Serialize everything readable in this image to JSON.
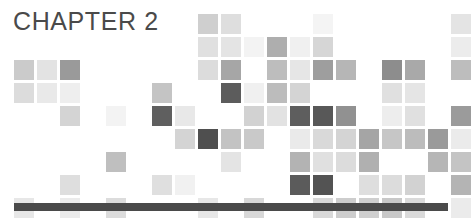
{
  "page": {
    "width": 461,
    "height": 222,
    "background": "#ffffff"
  },
  "header": {
    "title": "CHAPTER 2",
    "title_color": "#4a4a4a"
  },
  "rule": {
    "label": "horizontal-rule",
    "color": "#4a4a4a",
    "x": 14,
    "y": 203,
    "width": 434,
    "height": 8
  },
  "mosaic": {
    "label": "decorative-square-mosaic",
    "origin_x": 14,
    "origin_y": 14,
    "cell": 20,
    "pitch": 23,
    "columns": 20,
    "rows": 8,
    "palette": {
      "faint": "#f2f2f2",
      "pale": "#ebebeb",
      "light": "#e2e2e2",
      "light_mid": "#d8d8d8",
      "mid": "#cccccc",
      "mid_dark": "#b4b4b4",
      "gray": "#a0a0a0",
      "dark_gray": "#8c8c8c",
      "dark": "#6e6e6e",
      "darkest": "#4f4f4f"
    },
    "tiles": [
      {
        "c": 8,
        "r": 0,
        "color": "#cfcfcf"
      },
      {
        "c": 9,
        "r": 0,
        "color": "#dedede"
      },
      {
        "c": 13,
        "r": 0,
        "color": "#f4f4f4"
      },
      {
        "c": 19,
        "r": 0,
        "color": "#e4e4e4"
      },
      {
        "c": 8,
        "r": 1,
        "color": "#e0e0e0"
      },
      {
        "c": 9,
        "r": 1,
        "color": "#e4e4e4"
      },
      {
        "c": 10,
        "r": 1,
        "color": "#f3f3f3"
      },
      {
        "c": 11,
        "r": 1,
        "color": "#aeaeae"
      },
      {
        "c": 12,
        "r": 1,
        "color": "#f0f0f0"
      },
      {
        "c": 13,
        "r": 1,
        "color": "#d6d6d6"
      },
      {
        "c": 19,
        "r": 1,
        "color": "#ececec"
      },
      {
        "c": 0,
        "r": 2,
        "color": "#cbcbcb"
      },
      {
        "c": 1,
        "r": 2,
        "color": "#e3e3e3"
      },
      {
        "c": 2,
        "r": 2,
        "color": "#9a9a9a"
      },
      {
        "c": 8,
        "r": 2,
        "color": "#dcdcdc"
      },
      {
        "c": 9,
        "r": 2,
        "color": "#a6a6a6"
      },
      {
        "c": 11,
        "r": 2,
        "color": "#bdbdbd"
      },
      {
        "c": 12,
        "r": 2,
        "color": "#e6e6e6"
      },
      {
        "c": 13,
        "r": 2,
        "color": "#9e9e9e"
      },
      {
        "c": 14,
        "r": 2,
        "color": "#b6b6b6"
      },
      {
        "c": 16,
        "r": 2,
        "color": "#8d8d8d"
      },
      {
        "c": 17,
        "r": 2,
        "color": "#a9a9a9"
      },
      {
        "c": 19,
        "r": 2,
        "color": "#bdbdbd"
      },
      {
        "c": 0,
        "r": 3,
        "color": "#dcdcdc"
      },
      {
        "c": 1,
        "r": 3,
        "color": "#e9e9e9"
      },
      {
        "c": 2,
        "r": 3,
        "color": "#eeeeee"
      },
      {
        "c": 6,
        "r": 3,
        "color": "#c4c4c4"
      },
      {
        "c": 9,
        "r": 3,
        "color": "#5c5c5c"
      },
      {
        "c": 10,
        "r": 3,
        "color": "#f0f0f0"
      },
      {
        "c": 11,
        "r": 3,
        "color": "#bcbcbc"
      },
      {
        "c": 12,
        "r": 3,
        "color": "#d4d4d4"
      },
      {
        "c": 16,
        "r": 3,
        "color": "#e0e0e0"
      },
      {
        "c": 17,
        "r": 3,
        "color": "#e5e5e5"
      },
      {
        "c": 2,
        "r": 4,
        "color": "#d4d4d4"
      },
      {
        "c": 4,
        "r": 4,
        "color": "#f3f3f3"
      },
      {
        "c": 6,
        "r": 4,
        "color": "#5f5f5f"
      },
      {
        "c": 7,
        "r": 4,
        "color": "#e8e8e8"
      },
      {
        "c": 10,
        "r": 4,
        "color": "#d2d2d2"
      },
      {
        "c": 11,
        "r": 4,
        "color": "#e2e2e2"
      },
      {
        "c": 12,
        "r": 4,
        "color": "#5e5e5e"
      },
      {
        "c": 13,
        "r": 4,
        "color": "#585858"
      },
      {
        "c": 14,
        "r": 4,
        "color": "#919191"
      },
      {
        "c": 16,
        "r": 4,
        "color": "#ededed"
      },
      {
        "c": 17,
        "r": 4,
        "color": "#e0e0e0"
      },
      {
        "c": 19,
        "r": 4,
        "color": "#9b9b9b"
      },
      {
        "c": 7,
        "r": 5,
        "color": "#d4d4d4"
      },
      {
        "c": 8,
        "r": 5,
        "color": "#4f4f4f"
      },
      {
        "c": 9,
        "r": 5,
        "color": "#c3c3c3"
      },
      {
        "c": 10,
        "r": 5,
        "color": "#c9c9c9"
      },
      {
        "c": 12,
        "r": 5,
        "color": "#eaeaea"
      },
      {
        "c": 13,
        "r": 5,
        "color": "#d9d9d9"
      },
      {
        "c": 14,
        "r": 5,
        "color": "#d4d4d4"
      },
      {
        "c": 15,
        "r": 5,
        "color": "#a5a5a5"
      },
      {
        "c": 16,
        "r": 5,
        "color": "#c6c6c6"
      },
      {
        "c": 17,
        "r": 5,
        "color": "#bcbcbc"
      },
      {
        "c": 18,
        "r": 5,
        "color": "#9a9a9a"
      },
      {
        "c": 19,
        "r": 5,
        "color": "#ebebeb"
      },
      {
        "c": 4,
        "r": 6,
        "color": "#bfbfbf"
      },
      {
        "c": 9,
        "r": 6,
        "color": "#e4e4e4"
      },
      {
        "c": 12,
        "r": 6,
        "color": "#b3b3b3"
      },
      {
        "c": 13,
        "r": 6,
        "color": "#e0e0e0"
      },
      {
        "c": 14,
        "r": 6,
        "color": "#dcdcdc"
      },
      {
        "c": 15,
        "r": 6,
        "color": "#b0b0b0"
      },
      {
        "c": 18,
        "r": 6,
        "color": "#b6b6b6"
      },
      {
        "c": 19,
        "r": 6,
        "color": "#c4c4c4"
      },
      {
        "c": 2,
        "r": 7,
        "color": "#dedede"
      },
      {
        "c": 6,
        "r": 7,
        "color": "#dfdfdf"
      },
      {
        "c": 7,
        "r": 7,
        "color": "#f1f1f1"
      },
      {
        "c": 12,
        "r": 7,
        "color": "#5b5b5b"
      },
      {
        "c": 13,
        "r": 7,
        "color": "#535353"
      },
      {
        "c": 15,
        "r": 7,
        "color": "#dedede"
      },
      {
        "c": 16,
        "r": 7,
        "color": "#dcdcdc"
      },
      {
        "c": 17,
        "r": 7,
        "color": "#d2d2d2"
      },
      {
        "c": 19,
        "r": 7,
        "color": "#b4b4b4"
      },
      {
        "c": 0,
        "r": 8,
        "color": "#e7e7e7"
      },
      {
        "c": 2,
        "r": 8,
        "color": "#ebebeb"
      },
      {
        "c": 4,
        "r": 8,
        "color": "#dcdcdc"
      },
      {
        "c": 8,
        "r": 8,
        "color": "#e7e7e7"
      },
      {
        "c": 10,
        "r": 8,
        "color": "#d8d8d8"
      },
      {
        "c": 13,
        "r": 8,
        "color": "#d9d9d9"
      },
      {
        "c": 14,
        "r": 8,
        "color": "#cdcdcd"
      },
      {
        "c": 15,
        "r": 8,
        "color": "#cfcfcf"
      },
      {
        "c": 16,
        "r": 8,
        "color": "#c8c8c8"
      },
      {
        "c": 17,
        "r": 8,
        "color": "#dadada"
      },
      {
        "c": 19,
        "r": 8,
        "color": "#ebebeb"
      }
    ]
  }
}
